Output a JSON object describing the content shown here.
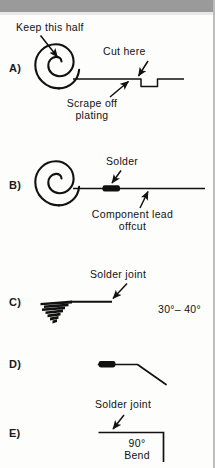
{
  "figure": {
    "background_color": "#fdfdfc",
    "ink_color": "#111111",
    "scan_band_color": "#9a9a9a",
    "edge_rule_color": "#bdbdbd"
  },
  "panels": [
    {
      "id": "A",
      "label": "A)",
      "callouts": [
        {
          "name": "keep-this-half",
          "text": "Keep this half"
        },
        {
          "name": "cut-here",
          "text": "Cut here"
        },
        {
          "name": "scrape-off-plating-line1",
          "text": "Scrape off"
        },
        {
          "name": "scrape-off-plating-line2",
          "text": "plating"
        }
      ]
    },
    {
      "id": "B",
      "label": "B)",
      "callouts": [
        {
          "name": "solder",
          "text": "Solder"
        },
        {
          "name": "component-lead-line1",
          "text": "Component  lead"
        },
        {
          "name": "component-lead-line2",
          "text": "offcut"
        }
      ]
    },
    {
      "id": "C",
      "label": "C)",
      "callouts": [
        {
          "name": "solder-joint",
          "text": "Solder  joint"
        },
        {
          "name": "angle-range",
          "text": "30°– 40°"
        }
      ]
    },
    {
      "id": "D",
      "label": "D)",
      "callouts": []
    },
    {
      "id": "E",
      "label": "E)",
      "callouts": [
        {
          "name": "solder-joint",
          "text": "Solder  joint"
        },
        {
          "name": "bend-angle",
          "text": "90°"
        },
        {
          "name": "bend-word",
          "text": "Bend"
        }
      ]
    }
  ],
  "icons": {
    "spiral": "spiral-coil-icon",
    "arrow": "arrow-pointer-icon",
    "solder_blob": "solder-blob-icon",
    "wire": "wire-line-icon"
  }
}
